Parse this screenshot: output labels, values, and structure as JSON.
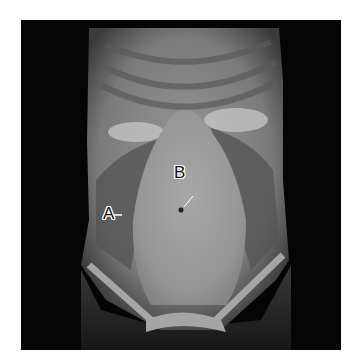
{
  "image": {
    "subject": "anterior abdominal wall, dissected torso",
    "labels": [
      {
        "id": "A",
        "text": "A"
      },
      {
        "id": "B",
        "text": "B"
      }
    ]
  }
}
